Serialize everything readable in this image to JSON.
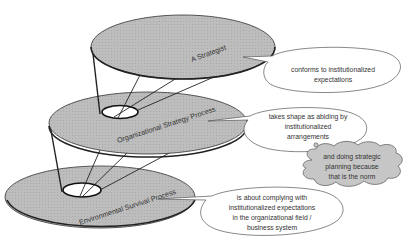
{
  "diagram": {
    "colors": {
      "disc_fill": "#b8b8b8",
      "disc_stroke": "#222222",
      "callout_fill": "#ffffff",
      "callout_stroke": "#555555",
      "thought_fill": "#c4c4c4",
      "text": "#333333"
    },
    "levels": [
      {
        "label": "A Strategist",
        "callout": [
          "conforms to institutionalized",
          "expectations"
        ]
      },
      {
        "label": "Organizational Strategy Process",
        "callout": [
          "takes shape as abiding by",
          "institutionalized",
          "arrangements"
        ]
      },
      {
        "label": "Environmental Survival Process",
        "callout": [
          "is about complying with",
          "institutionalized expectations",
          "in the organizational field /",
          "business system"
        ]
      }
    ],
    "thought_bubble": [
      "and doing strategic",
      "planning because",
      "that is the norm"
    ]
  }
}
